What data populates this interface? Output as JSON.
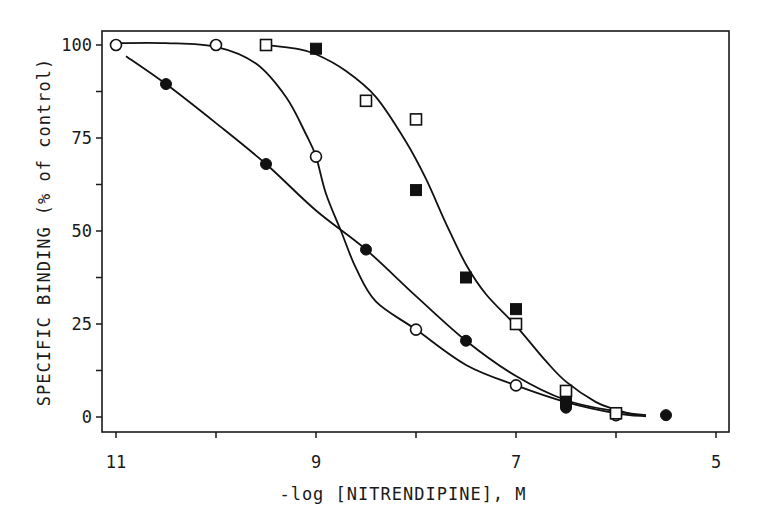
{
  "chart_data": {
    "type": "scatter",
    "title": "",
    "xlabel": "-log [NITRENDIPINE], M",
    "ylabel": "SPECIFIC BINDING (% of control)",
    "xlim": [
      11,
      5
    ],
    "ylim": [
      0,
      100
    ],
    "x_ticks": [
      11,
      10,
      9,
      8,
      7,
      6,
      5
    ],
    "x_tick_labels": [
      "11",
      "9",
      "7",
      "5"
    ],
    "y_ticks": [
      0,
      12.5,
      25,
      37.5,
      50,
      62.5,
      75,
      87.5,
      100
    ],
    "y_tick_labels": [
      "0",
      "25",
      "50",
      "75",
      "100"
    ],
    "grid": false,
    "legend": null,
    "series": [
      {
        "name": "open circles",
        "marker": "open-circle",
        "x": [
          11,
          10,
          9,
          8,
          7,
          6
        ],
        "y": [
          100,
          100,
          70,
          23.5,
          8.5,
          0.5
        ],
        "curve": [
          [
            11,
            100.5
          ],
          [
            10.5,
            100.5
          ],
          [
            10,
            99.5
          ],
          [
            9.6,
            95
          ],
          [
            9.3,
            86
          ],
          [
            9.1,
            76
          ],
          [
            9,
            70
          ],
          [
            8.9,
            60
          ],
          [
            8.75,
            50
          ],
          [
            8.6,
            40
          ],
          [
            8.4,
            31
          ],
          [
            8,
            23.5
          ],
          [
            7.5,
            14
          ],
          [
            7,
            8.5
          ],
          [
            6.5,
            4
          ],
          [
            6,
            1
          ],
          [
            5.7,
            0.2
          ]
        ]
      },
      {
        "name": "filled circles",
        "marker": "filled-circle",
        "x": [
          10.5,
          9.5,
          8.5,
          7.5,
          6.5,
          5.5
        ],
        "y": [
          89.5,
          68,
          45,
          20.5,
          2.5,
          0.5
        ],
        "curve": [
          [
            10.9,
            97
          ],
          [
            10.5,
            89.5
          ],
          [
            10,
            79
          ],
          [
            9.5,
            68
          ],
          [
            9,
            55.5
          ],
          [
            8.5,
            45
          ],
          [
            8,
            32.5
          ],
          [
            7.5,
            20.5
          ],
          [
            7,
            11
          ],
          [
            6.5,
            4.5
          ],
          [
            6,
            1.5
          ],
          [
            5.7,
            0.5
          ]
        ]
      },
      {
        "name": "open squares",
        "marker": "open-square",
        "x": [
          9.5,
          8.5,
          8,
          7,
          6.5,
          6
        ],
        "y": [
          100,
          85,
          80,
          25,
          7,
          1
        ],
        "curve": [
          [
            9.5,
            100
          ],
          [
            9.2,
            99
          ],
          [
            9,
            97.5
          ],
          [
            8.7,
            93
          ],
          [
            8.4,
            86
          ],
          [
            8.1,
            74
          ],
          [
            7.9,
            64
          ],
          [
            7.7,
            52
          ],
          [
            7.5,
            41
          ],
          [
            7.3,
            33
          ],
          [
            7,
            24.5
          ],
          [
            6.7,
            15
          ],
          [
            6.5,
            9.5
          ],
          [
            6.2,
            4
          ],
          [
            6,
            2
          ],
          [
            5.8,
            0.5
          ]
        ]
      },
      {
        "name": "filled squares",
        "marker": "filled-square",
        "x": [
          9,
          8,
          7.5,
          7,
          6.5
        ],
        "y": [
          99,
          61,
          37.5,
          29,
          4
        ],
        "curve": null
      }
    ]
  }
}
